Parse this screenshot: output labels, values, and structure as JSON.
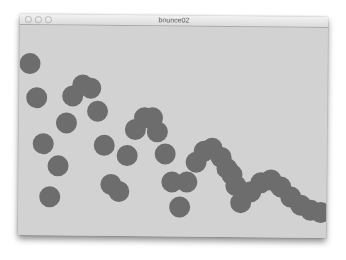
{
  "window": {
    "title": "bounce02",
    "buttons": [
      {
        "name": "close",
        "x": 9
      },
      {
        "name": "minimize",
        "x": 19
      },
      {
        "name": "zoom",
        "x": 29
      }
    ]
  },
  "canvas": {
    "background": "#d2d2d2",
    "ball_color": "#6d6d6d",
    "ball_diameter": 21,
    "balls": [
      {
        "x": 30,
        "y": 64
      },
      {
        "x": 37,
        "y": 98
      },
      {
        "x": 73,
        "y": 96
      },
      {
        "x": 83,
        "y": 85
      },
      {
        "x": 91,
        "y": 88
      },
      {
        "x": 98,
        "y": 111
      },
      {
        "x": 67,
        "y": 123
      },
      {
        "x": 44,
        "y": 144
      },
      {
        "x": 59,
        "y": 166
      },
      {
        "x": 51,
        "y": 197
      },
      {
        "x": 105,
        "y": 145
      },
      {
        "x": 112,
        "y": 184
      },
      {
        "x": 120,
        "y": 191
      },
      {
        "x": 128,
        "y": 156
      },
      {
        "x": 136,
        "y": 130
      },
      {
        "x": 145,
        "y": 118
      },
      {
        "x": 153,
        "y": 118
      },
      {
        "x": 158,
        "y": 132
      },
      {
        "x": 166,
        "y": 154
      },
      {
        "x": 173,
        "y": 182
      },
      {
        "x": 188,
        "y": 182
      },
      {
        "x": 181,
        "y": 207
      },
      {
        "x": 197,
        "y": 162
      },
      {
        "x": 205,
        "y": 151
      },
      {
        "x": 213,
        "y": 148
      },
      {
        "x": 222,
        "y": 157
      },
      {
        "x": 228,
        "y": 168
      },
      {
        "x": 233,
        "y": 175
      },
      {
        "x": 237,
        "y": 186
      },
      {
        "x": 242,
        "y": 203
      },
      {
        "x": 252,
        "y": 192
      },
      {
        "x": 262,
        "y": 183
      },
      {
        "x": 272,
        "y": 180
      },
      {
        "x": 282,
        "y": 187
      },
      {
        "x": 292,
        "y": 197
      },
      {
        "x": 302,
        "y": 205
      },
      {
        "x": 312,
        "y": 210
      },
      {
        "x": 322,
        "y": 212
      }
    ]
  }
}
